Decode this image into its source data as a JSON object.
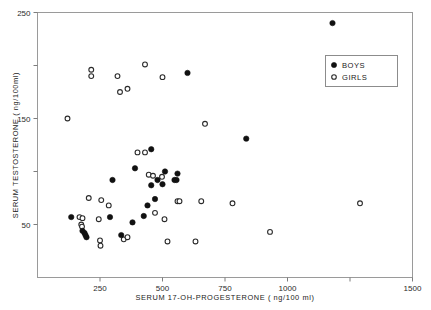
{
  "chart_data": {
    "type": "scatter",
    "title": "",
    "xlabel": "SERUM   17-OH-PROGESTERONE      ( ng/100 ml)",
    "ylabel": "SERUM  TESTOSTERONE   ( ng/100ml)",
    "xlim": [
      0,
      1500
    ],
    "ylim": [
      0,
      250
    ],
    "grid": false,
    "xticks": [
      250,
      500,
      750,
      1000,
      1250,
      1500
    ],
    "xticklabels": [
      "250",
      "500",
      "750",
      "1000",
      "",
      "1500"
    ],
    "yticks": [
      50,
      100,
      150,
      200,
      250
    ],
    "yticklabels": [
      "50",
      "",
      "150",
      "",
      "250"
    ],
    "legend_position": "upper right",
    "series": [
      {
        "name": "BOYS",
        "marker": "filled-circle",
        "color": "#111111",
        "points": [
          [
            1180,
            240
          ],
          [
            600,
            193
          ],
          [
            835,
            131
          ],
          [
            455,
            121
          ],
          [
            390,
            103
          ],
          [
            510,
            100
          ],
          [
            560,
            98
          ],
          [
            480,
            92
          ],
          [
            548,
            92
          ],
          [
            556,
            92
          ],
          [
            300,
            92
          ],
          [
            470,
            74
          ],
          [
            440,
            68
          ],
          [
            425,
            58
          ],
          [
            135,
            57
          ],
          [
            290,
            57
          ],
          [
            380,
            52
          ],
          [
            180,
            44
          ],
          [
            188,
            42
          ],
          [
            192,
            40
          ],
          [
            196,
            38
          ],
          [
            335,
            40
          ],
          [
            455,
            87
          ],
          [
            500,
            88
          ]
        ]
      },
      {
        "name": "GIRLS",
        "marker": "open-circle",
        "color": "#ffffff",
        "points": [
          [
            215,
            196
          ],
          [
            430,
            201
          ],
          [
            500,
            189
          ],
          [
            330,
            175
          ],
          [
            360,
            178
          ],
          [
            120,
            150
          ],
          [
            670,
            145
          ],
          [
            430,
            118
          ],
          [
            215,
            190
          ],
          [
            320,
            190
          ],
          [
            445,
            97
          ],
          [
            462,
            96
          ],
          [
            498,
            95
          ],
          [
            205,
            75
          ],
          [
            255,
            73
          ],
          [
            285,
            68
          ],
          [
            560,
            72
          ],
          [
            568,
            72
          ],
          [
            780,
            70
          ],
          [
            470,
            61
          ],
          [
            1290,
            70
          ],
          [
            655,
            72
          ],
          [
            168,
            57
          ],
          [
            175,
            50
          ],
          [
            178,
            48
          ],
          [
            245,
            55
          ],
          [
            250,
            35
          ],
          [
            252,
            30
          ],
          [
            345,
            36
          ],
          [
            360,
            38
          ],
          [
            520,
            34
          ],
          [
            632,
            34
          ],
          [
            930,
            43
          ],
          [
            508,
            55
          ],
          [
            400,
            118
          ],
          [
            180,
            56
          ]
        ]
      }
    ]
  },
  "legend": {
    "entries": [
      {
        "label": "BOYS",
        "marker": "filled-circle"
      },
      {
        "label": "GIRLS",
        "marker": "open-circle"
      }
    ]
  }
}
